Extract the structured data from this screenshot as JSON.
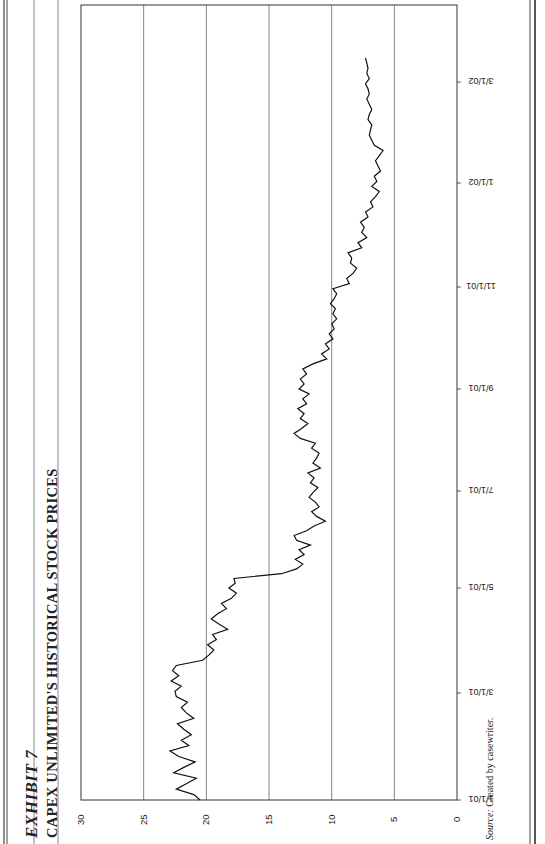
{
  "header": {
    "exhibit_label": "EXHIBIT 7",
    "title": "CAPEX UNLIMITED'S HISTORICAL STOCK PRICES"
  },
  "footer": {
    "source_label": "Source:",
    "source_text": "Created by casewriter."
  },
  "chart_data": {
    "type": "line",
    "title": "CAPEX UNLIMITED'S HISTORICAL STOCK PRICES",
    "xlabel": "",
    "ylabel": "",
    "ylim": [
      0,
      30
    ],
    "yticks": [
      "0",
      "5",
      "10",
      "15",
      "20",
      "25",
      "30"
    ],
    "xticks": [
      "1/1/01",
      "3/1/01",
      "5/1/01",
      "7/1/01",
      "9/1/01",
      "11/1/01",
      "1/1/02",
      "3/1/02"
    ],
    "grid": "horizontal",
    "legend": "none",
    "orientation": "page rotated 90 degrees counter-clockwise",
    "series": [
      {
        "name": "Stock Price",
        "x_days": [
          0,
          3,
          6,
          9,
          12,
          15,
          18,
          21,
          24,
          27,
          30,
          33,
          36,
          39,
          42,
          45,
          48,
          51,
          54,
          57,
          60,
          63,
          66,
          69,
          72,
          75,
          78,
          81,
          84,
          87,
          90,
          93,
          96,
          99,
          102,
          105,
          108,
          111,
          114,
          117,
          120,
          123,
          126,
          129,
          132,
          135,
          138,
          141,
          144,
          147,
          150,
          153,
          156,
          159,
          162,
          165,
          168,
          171,
          174,
          177,
          180,
          183,
          186,
          189,
          192,
          195,
          198,
          201,
          204,
          207,
          210,
          213,
          216,
          219,
          222,
          225,
          228,
          231,
          234,
          237,
          240,
          243,
          246,
          249,
          252,
          255,
          258,
          261,
          264,
          267,
          270,
          273,
          276,
          279,
          282,
          285,
          288,
          291,
          294,
          297,
          300,
          303,
          306,
          309,
          312,
          315,
          318,
          321,
          324,
          327,
          330,
          333,
          336,
          339,
          342,
          345,
          348,
          351,
          354,
          357,
          360,
          363,
          366,
          369,
          372,
          375,
          378,
          381,
          384,
          387,
          390,
          393,
          396,
          399,
          402,
          405,
          408,
          411,
          414,
          417,
          420,
          423,
          426,
          429,
          432,
          435,
          438,
          441,
          444
        ],
        "values": [
          20.5,
          21.0,
          22.4,
          21.6,
          20.8,
          22.6,
          21.8,
          20.9,
          22.2,
          22.9,
          21.4,
          22.0,
          21.2,
          21.8,
          22.3,
          21.0,
          21.6,
          22.0,
          21.5,
          22.4,
          22.5,
          22.0,
          22.8,
          22.2,
          22.7,
          22.4,
          20.3,
          19.8,
          19.4,
          19.9,
          19.2,
          19.5,
          18.3,
          19.0,
          19.6,
          19.1,
          18.4,
          18.8,
          18.0,
          17.6,
          18.2,
          17.7,
          17.8,
          14.0,
          12.8,
          12.3,
          12.9,
          12.2,
          12.6,
          11.7,
          12.8,
          13.0,
          12.0,
          11.4,
          10.5,
          11.2,
          11.6,
          11.0,
          11.3,
          11.8,
          11.5,
          11.1,
          11.7,
          11.4,
          11.9,
          10.9,
          11.5,
          11.2,
          11.0,
          11.6,
          11.3,
          12.5,
          13.0,
          12.4,
          11.9,
          12.5,
          12.2,
          12.7,
          12.0,
          12.3,
          11.8,
          12.6,
          12.2,
          12.5,
          12.0,
          12.3,
          11.5,
          10.4,
          10.8,
          10.2,
          10.5,
          9.9,
          10.2,
          9.8,
          10.0,
          9.6,
          9.9,
          9.7,
          10.1,
          9.8,
          9.6,
          9.9,
          8.6,
          8.8,
          8.3,
          8.0,
          8.5,
          8.4,
          8.7,
          7.6,
          7.9,
          7.2,
          7.6,
          7.4,
          7.7,
          7.1,
          7.3,
          6.7,
          6.9,
          6.5,
          6.2,
          6.8,
          6.4,
          6.6,
          6.1,
          6.3,
          6.5,
          6.2,
          5.9,
          6.6,
          6.8,
          7.0,
          6.9,
          6.8,
          7.1,
          7.0,
          6.8,
          7.0,
          7.2,
          7.0,
          7.1,
          7.3,
          7.0,
          7.2,
          7.1,
          7.2,
          7.3
        ]
      }
    ]
  }
}
